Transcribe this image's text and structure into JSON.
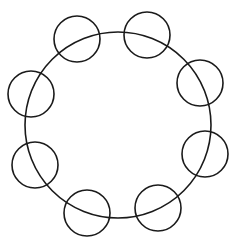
{
  "diagram": {
    "type": "circles-on-ring",
    "stroke_color": "#1a1a1a",
    "background": "#ffffff",
    "ring": {
      "cx": 118,
      "cy": 125,
      "r": 93
    },
    "small_circles": [
      {
        "cx": 77,
        "cy": 39,
        "r": 23
      },
      {
        "cx": 147,
        "cy": 35,
        "r": 23
      },
      {
        "cx": 200,
        "cy": 83,
        "r": 23
      },
      {
        "cx": 205,
        "cy": 154,
        "r": 23
      },
      {
        "cx": 158,
        "cy": 208,
        "r": 23
      },
      {
        "cx": 87,
        "cy": 213,
        "r": 23
      },
      {
        "cx": 35,
        "cy": 165,
        "r": 23
      },
      {
        "cx": 31,
        "cy": 94,
        "r": 23
      }
    ]
  }
}
